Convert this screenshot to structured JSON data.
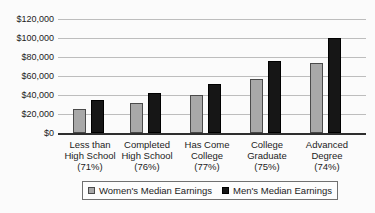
{
  "chart_data": {
    "type": "bar",
    "title": "",
    "categories": [
      "Less than High School (71%)",
      "Completed High School (76%)",
      "Has Come College (77%)",
      "College Graduate (75%)",
      "Advanced Degree (74%)"
    ],
    "category_lines": [
      [
        "Less than",
        "High School",
        "(71%)"
      ],
      [
        "Completed",
        "High School",
        "(76%)"
      ],
      [
        "Has Come",
        "College",
        "(77%)"
      ],
      [
        "College",
        "Graduate",
        "(75%)"
      ],
      [
        "Advanced",
        "Degree",
        "(74%)"
      ]
    ],
    "series": [
      {
        "name": "Women's Median Earnings",
        "values": [
          25000,
          32000,
          40000,
          57000,
          74000
        ],
        "color": "#a8a8a8",
        "border_color": "#4a4a4a"
      },
      {
        "name": "Men's Median Earnings",
        "values": [
          35000,
          42000,
          52000,
          76000,
          100000
        ],
        "color": "#161616",
        "border_color": "#000000"
      }
    ],
    "y_tick_labels": [
      "$120,000",
      "$100,000",
      "$80,000",
      "$60,000",
      "$40,000",
      "$20,000",
      "$0"
    ],
    "ylim": [
      0,
      120000
    ],
    "y_tick_step": 20000,
    "grid": "horizontal",
    "legend_position": "bottom",
    "xlabel": "",
    "ylabel": ""
  },
  "legend": {
    "women_label": "Women's Median Earnings",
    "men_label": "Men's Median Earnings"
  },
  "colors": {
    "background": "#fbfbfb",
    "gridline": "#bdbdbd",
    "axis_line": "#2e2e2e",
    "text": "#1c1c1c",
    "legend_border": "#707070",
    "women_bar": "#a8a8a8",
    "men_bar": "#161616"
  }
}
